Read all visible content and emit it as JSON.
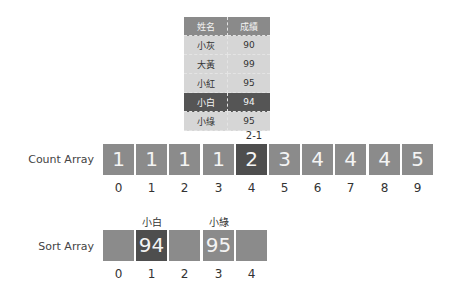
{
  "table": {
    "headers": [
      "姓名",
      "成績"
    ],
    "rows": [
      {
        "name": "小灰",
        "score": "90",
        "highlight": false
      },
      {
        "name": "大黃",
        "score": "99",
        "highlight": false
      },
      {
        "name": "小紅",
        "score": "95",
        "highlight": false
      },
      {
        "name": "小白",
        "score": "94",
        "highlight": true
      },
      {
        "name": "小綠",
        "score": "95",
        "highlight": false
      }
    ]
  },
  "count_array": {
    "label": "Count Array",
    "annotation": "2-1",
    "annotation_index": 4,
    "values": [
      "1",
      "1",
      "1",
      "1",
      "2",
      "3",
      "4",
      "4",
      "4",
      "5"
    ],
    "indices": [
      "0",
      "1",
      "2",
      "3",
      "4",
      "5",
      "6",
      "7",
      "8",
      "9"
    ],
    "highlight_index": 4
  },
  "sort_array": {
    "label": "Sort Array",
    "values": [
      "",
      "94",
      "",
      "95",
      ""
    ],
    "names": [
      "",
      "小白",
      "",
      "小綠",
      ""
    ],
    "indices": [
      "0",
      "1",
      "2",
      "3",
      "4"
    ],
    "highlight_index": 1
  },
  "colors": {
    "box": "#8b8b8b",
    "highlight": "#4e4e4e",
    "table_row": "#d6d6d6",
    "table_head": "#8a8a8a"
  }
}
